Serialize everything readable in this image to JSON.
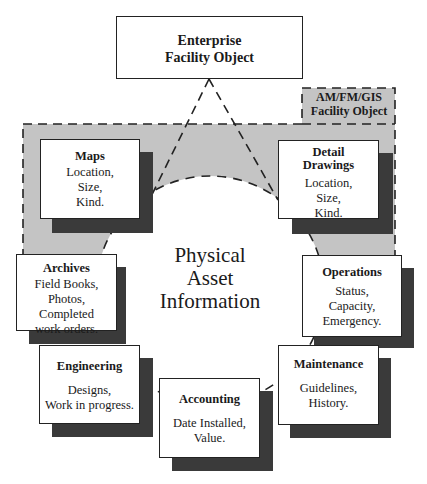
{
  "diagram": {
    "top_object": {
      "line1": "Enterprise",
      "line2": "Facility Object"
    },
    "amfm_object": {
      "line1": "AM/FM/GIS",
      "line2": "Facility Object"
    },
    "center": {
      "line1": "Physical",
      "line2": "Asset",
      "line3": "Information"
    },
    "nodes": [
      {
        "id": "maps",
        "title": "Maps",
        "lines": [
          "Location,",
          "Size,",
          "Kind."
        ]
      },
      {
        "id": "detail-drawings",
        "title_line1": "Detail",
        "title_line2": "Drawings",
        "lines": [
          "Location,",
          "Size,",
          "Kind."
        ]
      },
      {
        "id": "archives",
        "title": "Archives",
        "lines": [
          "Field Books,",
          "Photos,",
          "Completed",
          "work orders."
        ]
      },
      {
        "id": "operations",
        "title": "Operations",
        "lines": [
          "Status,",
          "Capacity,",
          "Emergency."
        ]
      },
      {
        "id": "engineering",
        "title": "Engineering",
        "lines": [
          "Designs,",
          "Work in progress."
        ]
      },
      {
        "id": "accounting",
        "title": "Accounting",
        "lines": [
          "Date Installed,",
          "Value."
        ]
      },
      {
        "id": "maintenance",
        "title": "Maintenance",
        "lines": [
          "Guidelines,",
          "History."
        ]
      }
    ],
    "colors": {
      "region_fill": "#c4c4c4",
      "shadow": "#3a3a3a",
      "border": "#222222"
    }
  }
}
